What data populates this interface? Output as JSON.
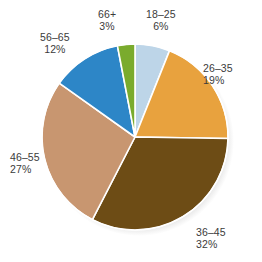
{
  "chart_data": {
    "type": "pie",
    "title": "",
    "subtitle": "",
    "xlabel": "",
    "ylabel": "",
    "legend_position": "none",
    "grid": false,
    "units": "percent",
    "start_angle_deg": 0,
    "direction": "clockwise",
    "categories": [
      "18–25",
      "26–35",
      "36–45",
      "46–55",
      "56–65",
      "66+"
    ],
    "values": [
      6,
      19,
      32,
      27,
      12,
      3
    ],
    "total": 99,
    "slices": [
      {
        "label": "18–25",
        "value": 6,
        "value_text": "6%",
        "color": "#bdd5e8",
        "label_align": "center",
        "label_left": 146,
        "label_top": 8
      },
      {
        "label": "26–35",
        "value": 19,
        "value_text": "19%",
        "color": "#e8a23e",
        "label_align": "left",
        "label_left": 203,
        "label_top": 62
      },
      {
        "label": "36–45",
        "value": 32,
        "value_text": "32%",
        "color": "#6d4c15",
        "label_align": "left",
        "label_left": 196,
        "label_top": 226
      },
      {
        "label": "46–55",
        "value": 27,
        "value_text": "27%",
        "color": "#c89670",
        "label_align": "left",
        "label_left": 10,
        "label_top": 151
      },
      {
        "label": "56–65",
        "value": 12,
        "value_text": "12%",
        "color": "#2d86c7",
        "label_align": "center",
        "label_left": 40,
        "label_top": 31
      },
      {
        "label": "66+",
        "value": 3,
        "value_text": "3%",
        "color": "#7aab2d",
        "label_align": "center",
        "label_left": 98,
        "label_top": 8
      }
    ],
    "style": {
      "background": "#ffffff",
      "text_color": "#3b3b3b",
      "separator_color": "#ffffff",
      "shadow_color": "#d2d2d2",
      "center_x": 135,
      "center_y": 137,
      "radius": 93
    }
  }
}
